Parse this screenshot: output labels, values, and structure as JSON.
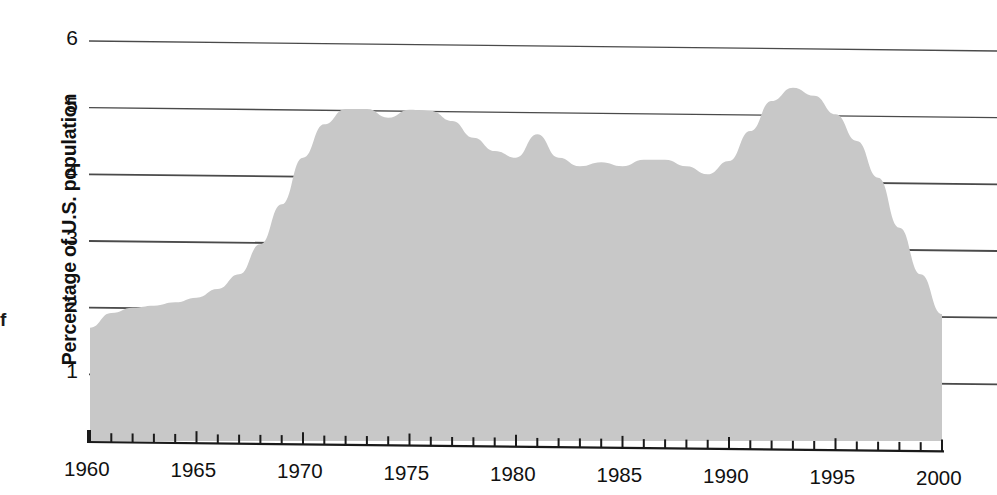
{
  "chart_data": {
    "type": "area",
    "title": "",
    "xlabel": "",
    "ylabel": "Percentage of U.S. population",
    "xlim": [
      1960,
      2000
    ],
    "ylim": [
      0,
      6
    ],
    "grid": true,
    "legend": null,
    "y_ticks": [
      1,
      2,
      3,
      4,
      5,
      6
    ],
    "y_tick_labels": [
      "1",
      "2",
      "3",
      "4",
      "5",
      "6"
    ],
    "x_ticks": [
      1960,
      1965,
      1970,
      1975,
      1980,
      1985,
      1990,
      1995,
      2000
    ],
    "x_tick_labels": [
      "1960",
      "1965",
      "1970",
      "1975",
      "1980",
      "1985",
      "1990",
      "1995",
      "2000"
    ],
    "x_minor_tick_interval": 1,
    "series_name": "Percentage of U.S. population",
    "x": [
      1960,
      1961,
      1962,
      1963,
      1964,
      1965,
      1966,
      1967,
      1968,
      1969,
      1970,
      1971,
      1972,
      1973,
      1974,
      1975,
      1976,
      1977,
      1978,
      1979,
      1980,
      1981,
      1982,
      1983,
      1984,
      1985,
      1986,
      1987,
      1988,
      1989,
      1990,
      1991,
      1992,
      1993,
      1994,
      1995,
      1996,
      1997,
      1998,
      1999,
      2000
    ],
    "values": [
      1.7,
      1.92,
      2.0,
      2.03,
      2.08,
      2.15,
      2.28,
      2.5,
      2.95,
      3.55,
      4.25,
      4.75,
      4.98,
      4.98,
      4.85,
      4.97,
      4.95,
      4.8,
      4.55,
      4.35,
      4.25,
      4.6,
      4.25,
      4.12,
      4.18,
      4.12,
      4.22,
      4.22,
      4.12,
      4.0,
      4.2,
      4.65,
      5.1,
      5.3,
      5.18,
      4.9,
      4.5,
      3.95,
      3.2,
      2.5,
      1.9
    ],
    "fill_color": "#c8c8c8",
    "gridline_color": "#4a4a4a",
    "axis_color": "#1a1a1a"
  },
  "figure": {
    "stray_margin_glyph": "f"
  }
}
